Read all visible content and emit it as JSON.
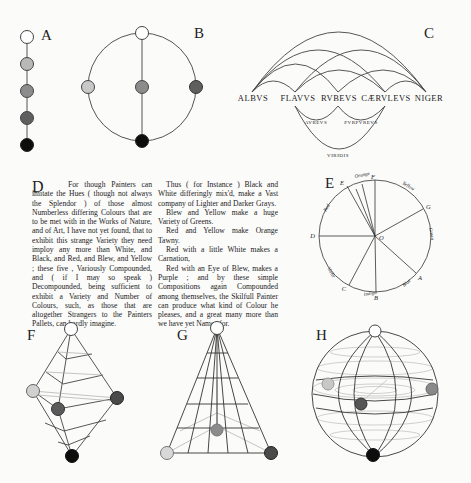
{
  "panels": {
    "A": {
      "label": "A",
      "nodes": [
        "#ffffff",
        "#b9b9b9",
        "#8c8c8c",
        "#5f5f5f",
        "#0d0d0d"
      ]
    },
    "B": {
      "label": "B",
      "nodes": {
        "top": "#ffffff",
        "left": "#c8c8c8",
        "center": "#8c8c8c",
        "right": "#5f5f5f",
        "bottom": "#0d0d0d"
      }
    },
    "C": {
      "label": "C",
      "primary_names": [
        "ALBVS",
        "FLAVVS",
        "RVBEVS",
        "CÆRVLEVS",
        "NIGER"
      ],
      "mixed_names": [
        "AVREVS",
        "PVRPVREVS"
      ],
      "bottom_name": "VIRIDIS"
    },
    "D": {
      "label": "D",
      "column1": [
        "For though Painters can imitate the Hues ( though not always the Splendor ) of those almost Numberless differing Colours that are to be met with in the Works of Nature, and of Art, I have not yet found, that to exhibit this strange Variety they need imploy any more than White, and Black, and Red, and Blew, and Yellow ; these five , Variously Compounded, and ( if I may so speak ) Decompounded, being sufficient to exhibit a Variety and Number of Colours, such, as those that are altogether Strangers to the Painters Pallets, can hardly imagine."
      ],
      "column2": [
        "Thus ( for Instance ) Black and White differingly mix'd, make a Vast company of Lighter and Darker Grays.",
        "Blew and Yellow make a huge Variety of Greens.",
        "Red and Yellow make Orange Tawny.",
        "Red with a little White makes a Carnation,",
        "Red with an Eye of Blew, makes a Purple ; and by these simple Compositions again Compounded among themselves, the Skilfull Painter can produce what kind of Colour he pleases, and a great many more than we have yet Names for."
      ]
    },
    "E": {
      "label": "E",
      "rim_letters": [
        "R",
        "F",
        "G",
        "A",
        "E",
        "C",
        "D"
      ],
      "center_letter": "O",
      "sector_names": [
        "Orange",
        "Yellow",
        "Green",
        "Blue",
        "Indigo",
        "Violet",
        "Red"
      ]
    },
    "F": {
      "label": "F",
      "nodes": {
        "top": "#ffffff",
        "left": "#d0d0d0",
        "front": "#5a5a5a",
        "right": "#4a4a4a",
        "bottom": "#0d0d0d"
      }
    },
    "G": {
      "label": "G",
      "nodes": {
        "top": "#ffffff",
        "left": "#d8d8d8",
        "center": "#8c8c8c",
        "right": "#4a4a4a"
      }
    },
    "H": {
      "label": "H",
      "nodes": {
        "top": "#ffffff",
        "left": "#c8c8c8",
        "front": "#555555",
        "right": "#8a8a8a",
        "bottom": "#0d0d0d"
      }
    }
  }
}
